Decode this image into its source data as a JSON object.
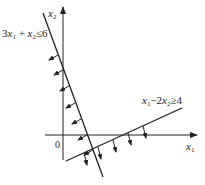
{
  "diagram": {
    "type": "linear-inequality-region",
    "colors": {
      "ink": "#222222",
      "background": "#ffffff"
    },
    "axes": {
      "x": {
        "label": "x",
        "sub": "1"
      },
      "y": {
        "label": "x",
        "sub": "2"
      },
      "origin_label": "0"
    },
    "constraints": [
      {
        "id": "c1",
        "label_parts": {
          "a": "3",
          "x1": "x",
          "s1": "1",
          "op1": " + ",
          "x2": "x",
          "s2": "2",
          "rel": "≤6"
        },
        "line": {
          "x1": 43,
          "y1": 13,
          "x2": 103,
          "y2": 177
        },
        "arrows": [
          {
            "x": 58,
            "y": 55
          },
          {
            "x": 63,
            "y": 70
          },
          {
            "x": 69,
            "y": 86
          },
          {
            "x": 75,
            "y": 103
          },
          {
            "x": 81,
            "y": 119
          },
          {
            "x": 87,
            "y": 135
          }
        ]
      },
      {
        "id": "c2",
        "label_parts": {
          "x1": "x",
          "s1": "1",
          "op1": "−2",
          "x2": "x",
          "s2": "2",
          "rel": "≥4"
        },
        "line": {
          "x1": 66,
          "y1": 161,
          "x2": 182,
          "y2": 108
        },
        "arrows": [
          {
            "x": 84,
            "y": 153
          },
          {
            "x": 98,
            "y": 147
          },
          {
            "x": 113,
            "y": 140
          },
          {
            "x": 128,
            "y": 133
          },
          {
            "x": 143,
            "y": 126
          }
        ]
      }
    ]
  }
}
